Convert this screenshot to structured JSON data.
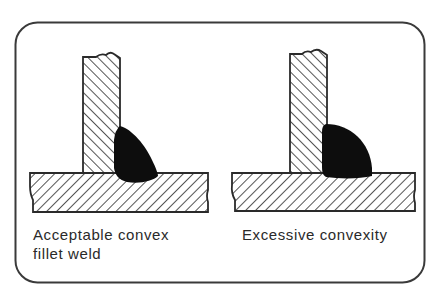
{
  "figure": {
    "panels": [
      {
        "id": "acceptable",
        "caption_lines": [
          "Acceptable convex",
          "fillet weld"
        ]
      },
      {
        "id": "excessive",
        "caption_lines": [
          "Excessive convexity"
        ]
      }
    ],
    "colors": {
      "ink": "#2a2a2a",
      "weld": "#0d0d0d",
      "frame": "#3a3a3a",
      "background": "#ffffff"
    }
  }
}
